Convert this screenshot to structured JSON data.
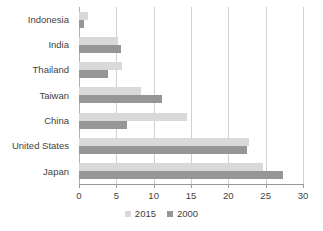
{
  "chart_data": {
    "type": "bar",
    "orientation": "horizontal",
    "title": "",
    "subtitle": "",
    "xlabel": "",
    "ylabel": "",
    "xlim": [
      0,
      30
    ],
    "xticks": [
      0,
      5,
      10,
      15,
      20,
      25,
      30
    ],
    "xtick_labels": [
      "0",
      "5",
      "10",
      "15",
      "20",
      "25",
      "30"
    ],
    "grid": "vertical",
    "legend_position": "bottom-center",
    "categories": [
      "Indonesia",
      "India",
      "Thailand",
      "Taiwan",
      "China",
      "United States",
      "Japan"
    ],
    "series": [
      {
        "name": "2015",
        "color": "#d9d9d9",
        "values": [
          1.2,
          5.2,
          5.8,
          8.3,
          14.5,
          22.8,
          24.6
        ]
      },
      {
        "name": "2000",
        "color": "#969696",
        "values": [
          0.7,
          5.6,
          3.9,
          11.1,
          6.4,
          22.5,
          27.3
        ]
      }
    ]
  },
  "legend": {
    "items": [
      {
        "label": "2015",
        "color": "#d9d9d9"
      },
      {
        "label": "2000",
        "color": "#969696"
      }
    ]
  },
  "colors": {
    "series_2015": "#d9d9d9",
    "series_2000": "#969696",
    "gridline": "#d0d0d0",
    "axis": "#9a9a9a",
    "text": "#3f3f3f",
    "background": "#ffffff"
  }
}
